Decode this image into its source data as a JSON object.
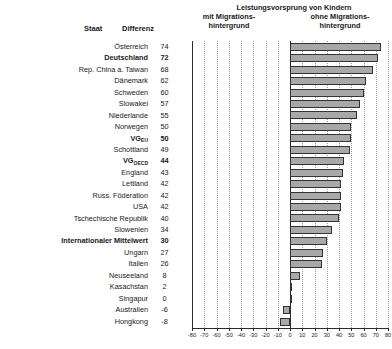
{
  "header": {
    "col_staat": "Staat",
    "col_differenz": "Differenz",
    "title": "Leistungsvorsprung von Kindern",
    "left_line1": "mit Migrations-",
    "left_line2": "hintergrund",
    "right_line1": "ohne Migrations-",
    "right_line2": "hintergrund"
  },
  "style": {
    "bar_fill": "#a8a8a8",
    "bar_stroke": "#333333",
    "axis_color": "#2b2b2b",
    "grid_color": "#9a9a9a"
  },
  "chart_data": {
    "type": "bar",
    "orientation": "horizontal",
    "title": "Leistungsvorsprung von Kindern",
    "xlabel": "",
    "ylabel": "",
    "xlim": [
      -80,
      80
    ],
    "xticks": [
      -80,
      -70,
      -60,
      -50,
      -40,
      -30,
      -20,
      -10,
      0,
      10,
      20,
      30,
      40,
      50,
      60,
      70,
      80
    ],
    "xticklabels": [
      "-80",
      "-70",
      "-60",
      "-50",
      "-40",
      "-30",
      "-20",
      "-10",
      "0",
      "10",
      "20",
      "30",
      "40",
      "50",
      "60",
      "70",
      "80"
    ],
    "grid": true,
    "legend": null,
    "value_column_header": "Differenz",
    "category_column_header": "Staat",
    "categories": [
      "Österreich",
      "Deutschland",
      "Rep. China a. Taiwan",
      "Dänemark",
      "Schweden",
      "Slowakei",
      "Niederlande",
      "Norwegen",
      "VG_EU",
      "Schottland",
      "VG_OECD",
      "England",
      "Lettland",
      "Russ. Föderation",
      "USA",
      "Tschechische Republik",
      "Slowenien",
      "Internationaler Mittelwert",
      "Ungarn",
      "Italien",
      "Neuseeland",
      "Kasachstan",
      "Singapur",
      "Australien",
      "Hongkong"
    ],
    "values": [
      74,
      72,
      68,
      62,
      60,
      57,
      55,
      50,
      50,
      49,
      44,
      43,
      42,
      42,
      42,
      40,
      34,
      30,
      27,
      26,
      8,
      2,
      0,
      -6,
      -8
    ]
  },
  "rows": [
    {
      "label": "Österreich",
      "value": "74",
      "num": 74,
      "bold": false
    },
    {
      "label": "Deutschland",
      "value": "72",
      "num": 72,
      "bold": true
    },
    {
      "label": "Rep. China a. Taiwan",
      "value": "68",
      "num": 68,
      "bold": false
    },
    {
      "label": "Dänemark",
      "value": "62",
      "num": 62,
      "bold": false
    },
    {
      "label": "Schweden",
      "value": "60",
      "num": 60,
      "bold": false
    },
    {
      "label": "Slowakei",
      "value": "57",
      "num": 57,
      "bold": false
    },
    {
      "label": "Niederlande",
      "value": "55",
      "num": 55,
      "bold": false
    },
    {
      "label": "Norwegen",
      "value": "50",
      "num": 50,
      "bold": false
    },
    {
      "label": "VG",
      "sub": "EU",
      "value": "50",
      "num": 50,
      "bold": true
    },
    {
      "label": "Schottland",
      "value": "49",
      "num": 49,
      "bold": false
    },
    {
      "label": "VG",
      "sub": "OECD",
      "value": "44",
      "num": 44,
      "bold": true
    },
    {
      "label": "England",
      "value": "43",
      "num": 43,
      "bold": false
    },
    {
      "label": "Lettland",
      "value": "42",
      "num": 42,
      "bold": false
    },
    {
      "label": "Russ. Föderation",
      "value": "42",
      "num": 42,
      "bold": false
    },
    {
      "label": "USA",
      "value": "42",
      "num": 42,
      "bold": false
    },
    {
      "label": "Tschechische Republik",
      "value": "40",
      "num": 40,
      "bold": false
    },
    {
      "label": "Slowenien",
      "value": "34",
      "num": 34,
      "bold": false
    },
    {
      "label": "Internationaler Mittelwert",
      "value": "30",
      "num": 30,
      "bold": true
    },
    {
      "label": "Ungarn",
      "value": "27",
      "num": 27,
      "bold": false
    },
    {
      "label": "Italien",
      "value": "26",
      "num": 26,
      "bold": false
    },
    {
      "label": "Neuseeland",
      "value": "8",
      "num": 8,
      "bold": false
    },
    {
      "label": "Kasachstan",
      "value": "2",
      "num": 2,
      "bold": false
    },
    {
      "label": "Singapur",
      "value": "0",
      "num": 0,
      "bold": false
    },
    {
      "label": "Australien",
      "value": "-6",
      "num": -6,
      "bold": false
    },
    {
      "label": "Hongkong",
      "value": "-8",
      "num": -8,
      "bold": false
    }
  ]
}
